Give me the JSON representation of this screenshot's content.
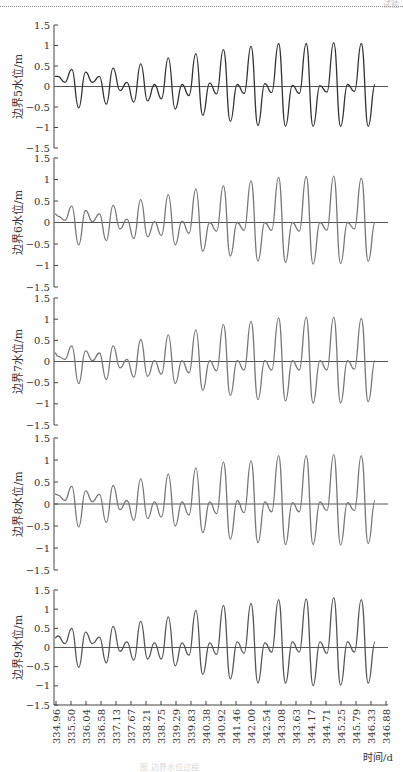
{
  "header": {
    "running_mark": "试验"
  },
  "chart_data": [
    {
      "type": "line",
      "ylabel": "边界5水位/m",
      "ylim": [
        -1.5,
        1.5
      ],
      "yticks": [
        "1.5",
        "1",
        "0.5",
        "0",
        "-0.5",
        "-1",
        "-1.5"
      ],
      "line_color": "#333333",
      "peaks": [
        0.25,
        0.42,
        0.35,
        0.25,
        0.45,
        0.1,
        0.55,
        0.05,
        0.7,
        0.05,
        0.8,
        0.08,
        0.9,
        0.05,
        0.98,
        0.07,
        1.05,
        0.03,
        1.05,
        0.02,
        1.07,
        0.05,
        1.05,
        0.05
      ],
      "troughs": [
        0.1,
        -0.52,
        0.1,
        -0.43,
        -0.1,
        -0.38,
        -0.35,
        -0.3,
        -0.55,
        -0.22,
        -0.7,
        -0.18,
        -0.85,
        -0.17,
        -0.95,
        -0.15,
        -0.97,
        -0.17,
        -0.97,
        -0.14,
        -0.97,
        -0.12,
        -0.97
      ]
    },
    {
      "type": "line",
      "ylabel": "边界6水位/m",
      "ylim": [
        -1.5,
        1.5
      ],
      "yticks": [
        "1.5",
        "1",
        "0.5",
        "0",
        "-0.5",
        "-1",
        "-1.5"
      ],
      "line_color": "#777777",
      "peaks": [
        0.15,
        0.38,
        0.28,
        0.2,
        0.4,
        0.08,
        0.53,
        0.02,
        0.65,
        0.03,
        0.78,
        0.0,
        0.85,
        0.0,
        0.97,
        0.0,
        1.05,
        0.0,
        1.07,
        0.0,
        1.08,
        0.0,
        1.03,
        0.0
      ],
      "troughs": [
        0.05,
        -0.52,
        0.02,
        -0.42,
        -0.15,
        -0.37,
        -0.33,
        -0.3,
        -0.52,
        -0.25,
        -0.67,
        -0.2,
        -0.78,
        -0.18,
        -0.9,
        -0.18,
        -0.93,
        -0.2,
        -0.97,
        -0.18,
        -0.95,
        -0.15,
        -0.9
      ]
    },
    {
      "type": "line",
      "ylabel": "边界7水位/m",
      "ylim": [
        -1.5,
        1.5
      ],
      "yticks": [
        "1.5",
        "1",
        "0.5",
        "0",
        "-0.5",
        "-1",
        "-1.5"
      ],
      "line_color": "#777777",
      "peaks": [
        0.12,
        0.37,
        0.25,
        0.2,
        0.37,
        0.05,
        0.52,
        0.02,
        0.63,
        0.02,
        0.75,
        0.02,
        0.87,
        0.02,
        0.95,
        0.02,
        1.03,
        0.02,
        1.05,
        0.02,
        1.05,
        0.02,
        1.02,
        0.02
      ],
      "troughs": [
        0.05,
        -0.52,
        0.02,
        -0.43,
        -0.15,
        -0.37,
        -0.35,
        -0.3,
        -0.52,
        -0.27,
        -0.68,
        -0.22,
        -0.8,
        -0.2,
        -0.9,
        -0.2,
        -0.93,
        -0.2,
        -0.98,
        -0.2,
        -0.98,
        -0.18,
        -0.95
      ]
    },
    {
      "type": "line",
      "ylabel": "边界8水位/m",
      "ylim": [
        -1.5,
        1.5
      ],
      "yticks": [
        "1.5",
        "1",
        "0.5",
        "0",
        "-0.5",
        "-1",
        "-1.5"
      ],
      "line_color": "#777777",
      "peaks": [
        0.2,
        0.4,
        0.3,
        0.22,
        0.42,
        0.08,
        0.57,
        0.05,
        0.68,
        0.05,
        0.82,
        0.05,
        0.95,
        0.08,
        0.98,
        0.05,
        1.1,
        0.03,
        1.1,
        0.05,
        1.12,
        0.03,
        1.1,
        0.08
      ],
      "troughs": [
        0.08,
        -0.52,
        0.05,
        -0.42,
        -0.13,
        -0.37,
        -0.33,
        -0.3,
        -0.5,
        -0.25,
        -0.65,
        -0.22,
        -0.8,
        -0.2,
        -0.88,
        -0.18,
        -0.92,
        -0.18,
        -0.92,
        -0.15,
        -0.93,
        -0.15,
        -0.9
      ]
    },
    {
      "type": "line",
      "ylabel": "边界9水位/m",
      "ylim": [
        -1.5,
        1.5
      ],
      "yticks": [
        "1.5",
        "1",
        "0.5",
        "0",
        "-0.5",
        "-1",
        "-1.5"
      ],
      "line_color": "#555555",
      "peaks": [
        0.3,
        0.5,
        0.4,
        0.27,
        0.55,
        0.15,
        0.68,
        0.12,
        0.8,
        0.12,
        0.97,
        0.12,
        1.1,
        0.15,
        1.15,
        0.12,
        1.25,
        0.15,
        1.27,
        0.15,
        1.3,
        0.15,
        1.25,
        0.15
      ],
      "troughs": [
        0.1,
        -0.52,
        0.1,
        -0.4,
        -0.1,
        -0.33,
        -0.3,
        -0.3,
        -0.48,
        -0.2,
        -0.7,
        -0.18,
        -0.82,
        -0.15,
        -0.92,
        -0.12,
        -0.93,
        -0.12,
        -1.0,
        -0.15,
        -0.98,
        -0.12,
        -0.93
      ]
    }
  ],
  "xaxis": {
    "xlabel": "时间/d",
    "xlim": [
      334.96,
      346.88
    ],
    "xticks": [
      "334.96",
      "335.50",
      "336.04",
      "336.58",
      "337.13",
      "337.67",
      "338.21",
      "338.75",
      "339.29",
      "339.83",
      "340.38",
      "340.92",
      "341.46",
      "342.00",
      "342.54",
      "343.08",
      "343.63",
      "344.17",
      "344.71",
      "345.25",
      "345.79",
      "346.33",
      "346.88"
    ]
  },
  "caption": "图 边界水位过程"
}
